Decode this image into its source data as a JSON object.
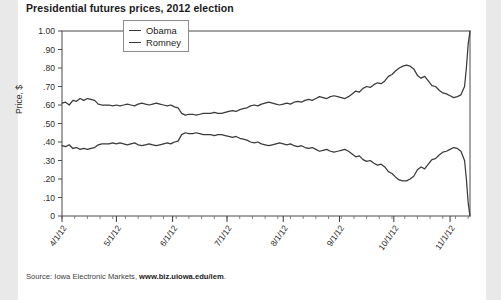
{
  "title": "Presidential futures prices, 2012 election",
  "source": {
    "prefix": "Source: Iowa Electronic Markets, ",
    "url": "www.biz.uiowa.edu/iem",
    "suffix": "."
  },
  "legend": {
    "items": [
      {
        "label": "Obama",
        "color": "#3a3a3a"
      },
      {
        "label": "Romney",
        "color": "#3a3a3a"
      }
    ]
  },
  "chart_data": {
    "type": "line",
    "title": "Presidential futures prices, 2012 election",
    "xlabel": "",
    "ylabel": "Price, $",
    "ylim": [
      0,
      1.0
    ],
    "ytick_labels": [
      "1.00",
      ".90",
      ".80",
      ".70",
      ".60",
      ".50",
      ".40",
      ".30",
      ".20",
      ".10",
      "0"
    ],
    "ytick_values": [
      1.0,
      0.9,
      0.8,
      0.7,
      0.6,
      0.5,
      0.4,
      0.3,
      0.2,
      0.1,
      0
    ],
    "xtick_labels": [
      "4/1/12",
      "5/1/12",
      "6/1/12",
      "7/1/12",
      "8/1/12",
      "9/1/12",
      "10/1/12",
      "11/1/12"
    ],
    "xtick_positions": [
      0,
      30,
      61,
      91,
      122,
      153,
      183,
      214
    ],
    "xlim": [
      0,
      225
    ],
    "grid": false,
    "legend_position": "top-left-inside",
    "series": [
      {
        "name": "Obama",
        "color": "#3a3a3a",
        "x": [
          0,
          2,
          4,
          6,
          8,
          10,
          12,
          14,
          16,
          18,
          20,
          22,
          24,
          26,
          28,
          30,
          32,
          34,
          36,
          38,
          40,
          42,
          44,
          46,
          48,
          50,
          52,
          54,
          56,
          58,
          60,
          61,
          62,
          64,
          66,
          68,
          70,
          72,
          74,
          76,
          78,
          80,
          82,
          84,
          86,
          88,
          90,
          92,
          94,
          96,
          98,
          100,
          102,
          104,
          106,
          108,
          110,
          112,
          114,
          116,
          118,
          120,
          122,
          124,
          126,
          128,
          130,
          132,
          134,
          136,
          138,
          140,
          142,
          144,
          146,
          148,
          150,
          152,
          154,
          156,
          158,
          160,
          162,
          164,
          166,
          168,
          170,
          172,
          174,
          176,
          178,
          180,
          182,
          184,
          186,
          188,
          190,
          192,
          194,
          196,
          198,
          200,
          202,
          204,
          206,
          208,
          210,
          212,
          214,
          216,
          218,
          220,
          222,
          223,
          224,
          225
        ],
        "y": [
          0.61,
          0.615,
          0.6,
          0.625,
          0.62,
          0.635,
          0.625,
          0.635,
          0.63,
          0.625,
          0.605,
          0.6,
          0.6,
          0.6,
          0.595,
          0.6,
          0.595,
          0.6,
          0.605,
          0.6,
          0.595,
          0.605,
          0.61,
          0.605,
          0.6,
          0.605,
          0.61,
          0.605,
          0.6,
          0.595,
          0.6,
          0.595,
          0.59,
          0.585,
          0.555,
          0.545,
          0.55,
          0.55,
          0.545,
          0.55,
          0.555,
          0.555,
          0.555,
          0.56,
          0.555,
          0.555,
          0.56,
          0.565,
          0.57,
          0.565,
          0.575,
          0.58,
          0.585,
          0.595,
          0.6,
          0.595,
          0.605,
          0.61,
          0.615,
          0.61,
          0.605,
          0.6,
          0.605,
          0.61,
          0.605,
          0.615,
          0.62,
          0.615,
          0.625,
          0.63,
          0.625,
          0.635,
          0.645,
          0.64,
          0.635,
          0.645,
          0.65,
          0.645,
          0.64,
          0.635,
          0.645,
          0.66,
          0.675,
          0.67,
          0.69,
          0.7,
          0.695,
          0.71,
          0.72,
          0.715,
          0.73,
          0.755,
          0.765,
          0.785,
          0.8,
          0.81,
          0.815,
          0.81,
          0.795,
          0.76,
          0.745,
          0.755,
          0.73,
          0.705,
          0.7,
          0.68,
          0.665,
          0.66,
          0.65,
          0.64,
          0.645,
          0.655,
          0.7,
          0.8,
          0.93,
          1.0
        ]
      },
      {
        "name": "Romney",
        "color": "#3a3a3a",
        "x": [
          0,
          2,
          4,
          6,
          8,
          10,
          12,
          14,
          16,
          18,
          20,
          22,
          24,
          26,
          28,
          30,
          32,
          34,
          36,
          38,
          40,
          42,
          44,
          46,
          48,
          50,
          52,
          54,
          56,
          58,
          60,
          61,
          62,
          64,
          66,
          68,
          70,
          72,
          74,
          76,
          78,
          80,
          82,
          84,
          86,
          88,
          90,
          92,
          94,
          96,
          98,
          100,
          102,
          104,
          106,
          108,
          110,
          112,
          114,
          116,
          118,
          120,
          122,
          124,
          126,
          128,
          130,
          132,
          134,
          136,
          138,
          140,
          142,
          144,
          146,
          148,
          150,
          152,
          154,
          156,
          158,
          160,
          162,
          164,
          166,
          168,
          170,
          172,
          174,
          176,
          178,
          180,
          182,
          184,
          186,
          188,
          190,
          192,
          194,
          196,
          198,
          200,
          202,
          204,
          206,
          208,
          210,
          212,
          214,
          216,
          218,
          220,
          222,
          223,
          224,
          225
        ],
        "y": [
          0.38,
          0.375,
          0.385,
          0.365,
          0.37,
          0.36,
          0.365,
          0.36,
          0.365,
          0.37,
          0.385,
          0.39,
          0.39,
          0.39,
          0.395,
          0.39,
          0.395,
          0.39,
          0.385,
          0.39,
          0.395,
          0.385,
          0.38,
          0.385,
          0.39,
          0.385,
          0.38,
          0.385,
          0.39,
          0.395,
          0.39,
          0.395,
          0.4,
          0.405,
          0.44,
          0.45,
          0.445,
          0.445,
          0.45,
          0.445,
          0.44,
          0.44,
          0.44,
          0.435,
          0.44,
          0.44,
          0.435,
          0.43,
          0.425,
          0.43,
          0.42,
          0.415,
          0.41,
          0.4,
          0.395,
          0.4,
          0.39,
          0.385,
          0.38,
          0.385,
          0.39,
          0.395,
          0.39,
          0.385,
          0.39,
          0.38,
          0.375,
          0.38,
          0.37,
          0.365,
          0.37,
          0.36,
          0.35,
          0.355,
          0.36,
          0.35,
          0.345,
          0.35,
          0.355,
          0.36,
          0.35,
          0.335,
          0.32,
          0.325,
          0.305,
          0.295,
          0.3,
          0.285,
          0.275,
          0.28,
          0.265,
          0.24,
          0.23,
          0.21,
          0.195,
          0.19,
          0.19,
          0.2,
          0.215,
          0.25,
          0.265,
          0.255,
          0.28,
          0.305,
          0.31,
          0.33,
          0.345,
          0.35,
          0.36,
          0.37,
          0.365,
          0.35,
          0.3,
          0.2,
          0.07,
          0.0
        ]
      }
    ],
    "annotations": []
  }
}
